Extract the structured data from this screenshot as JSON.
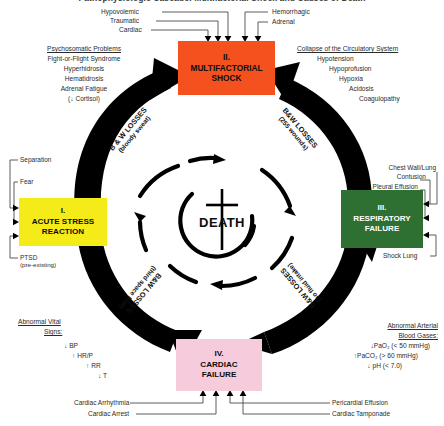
{
  "title": "Pathophysiologic Cascade: Multifactorial Shock and Causes of Death",
  "center": {
    "label": "DEATH",
    "symbol": "cross"
  },
  "nodes": [
    {
      "id": "acute-stress-reaction",
      "roman": "I.",
      "name_line1": "ACUTE STRESS",
      "name_line2": "REACTION",
      "color": "#F5EB19",
      "text_color": "#0d0d0d"
    },
    {
      "id": "multifactorial-shock",
      "roman": "II.",
      "name_line1": "MULTIFACTORIAL",
      "name_line2": "SHOCK",
      "color": "#F4511E",
      "text_color": "#0d0d0d"
    },
    {
      "id": "respiratory-failure",
      "roman": "III.",
      "name_line1": "RESPIRATORY",
      "name_line2": "FAILURE",
      "color": "#2E7031",
      "text_color": "#ffffff"
    },
    {
      "id": "cardiac-failure",
      "roman": "IV.",
      "name_line1": "CARDIAC",
      "name_line2": "FAILURE",
      "color": "#F6CBDC",
      "text_color": "#0d0d0d"
    }
  ],
  "shock_inputs_left": [
    "Hypovolemic",
    "Traumatic",
    "Cardiac"
  ],
  "shock_inputs_right": [
    "Hemorrhagic",
    "Adrenal"
  ],
  "psychosomatic": {
    "heading": "Psychosomatic Problems",
    "items": [
      "Fight-or-Flight Syndrome",
      "Hyperhidrosis",
      "Hematidrosis",
      "Adrenal Fatigue",
      "(↓ Cortisol)"
    ]
  },
  "circulatory": {
    "heading": "Collapse of the Circulatory System",
    "items": [
      "Hypotension",
      "Hypoprofusion",
      "Hypoxia",
      "Acidosis",
      "Coagulopathy"
    ]
  },
  "vital_signs": {
    "heading_line1": "Abnormal Vital",
    "heading_line2": "Signs:",
    "items": [
      "↓ BP",
      "↑ HR/P",
      "↑ RR",
      "↓ T"
    ]
  },
  "blood_gases": {
    "heading_line1": "Abnormal Arterial",
    "heading_line2": "Blood Gases:",
    "items": [
      "↓PaO₂  (< 50 mmHg)",
      "↑PaCO₂  (> 60 mmHg)",
      "↓ pH  (< 7.0)"
    ]
  },
  "stress_inputs": [
    "Separation",
    "Fear"
  ],
  "stress_input_ptsd": {
    "label": "PTSD",
    "sub": "(pre-existing)"
  },
  "respiratory_inputs": {
    "top_line1": "Chest Wall/Lung",
    "top_line2": "Contusion",
    "middle": "Pleural Effusion",
    "bottom": "Shock Lung"
  },
  "cardiac_inputs_left": [
    "Cardiac Arrhythmia",
    "Cardiac Arrest"
  ],
  "cardiac_inputs_right": [
    "Pericardial Effusion",
    "Cardiac Tamponade"
  ],
  "cycle_arrows": [
    {
      "id": "stress-to-shock",
      "main": "B & W LOSSES",
      "sub": "(bloody sweat)"
    },
    {
      "id": "shock-to-respiratory",
      "main": "B&W LOSSES",
      "sub": "(255 wounds)"
    },
    {
      "id": "respiratory-to-cardiac",
      "main": "B&W LOSSES",
      "sub": "(no fluid intake)"
    },
    {
      "id": "cardiac-to-stress",
      "main": "B&W LOSSES",
      "sub": "(third space loss)"
    }
  ],
  "colors": {
    "shock": "#F4511E",
    "stress": "#F5EB19",
    "respiratory": "#2E7031",
    "cardiac": "#F6CBDC",
    "arrow": "#000000",
    "connector": "#555555"
  }
}
